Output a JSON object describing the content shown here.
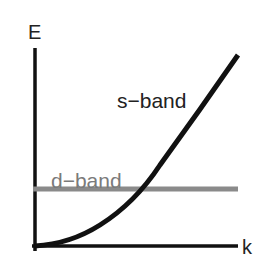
{
  "diagram": {
    "axes": {
      "y_label": "E",
      "x_label": "k"
    },
    "bands": [
      {
        "name": "s-band",
        "label": "s−band",
        "shape": "parabolic",
        "color": "#111111"
      },
      {
        "name": "d-band",
        "label": "d−band",
        "shape": "flat",
        "color": "#8a8a8a"
      }
    ],
    "colors": {
      "axis": "#111111",
      "s_band": "#111111",
      "d_band": "#8a8a8a",
      "label_text": "#222222",
      "d_band_label": "#7a7a7a",
      "background": "#ffffff"
    }
  }
}
